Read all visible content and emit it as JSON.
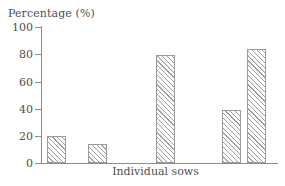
{
  "chart_data": {
    "type": "bar",
    "title": "",
    "ylabel": "Percentage (%)",
    "xlabel": "Individual sows",
    "categories": [
      "1",
      "2",
      "3",
      "4",
      "5"
    ],
    "values": [
      20,
      14,
      79,
      39,
      84
    ],
    "ytick_labels": [
      "100",
      "80",
      "60",
      "40",
      "20",
      "0"
    ],
    "ytick_values": [
      100,
      80,
      60,
      40,
      20,
      0
    ],
    "ylim": [
      0,
      100
    ],
    "xtick_labels": [],
    "grid": false,
    "legend": null,
    "bar_fill": "hatched-diagonal",
    "bar_edge_color": "#9a9a9a",
    "axis_color": "#8d8d8d",
    "text_color": "#4f4f4f",
    "background": "#ffffff"
  },
  "labels": {
    "y_axis_title": "Percentage (%)",
    "x_axis_title": "Individual sows",
    "tick_100": "100",
    "tick_80": "80",
    "tick_60": "60",
    "tick_40": "40",
    "tick_20": "20",
    "tick_0": "0"
  }
}
